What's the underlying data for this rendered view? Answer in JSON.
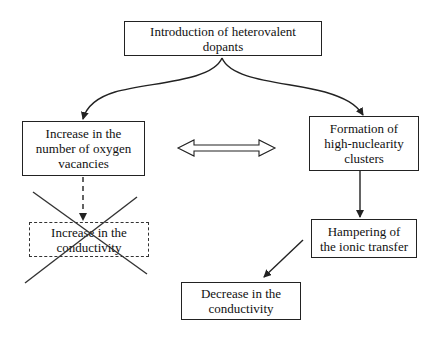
{
  "diagram": {
    "type": "flowchart",
    "nodes": [
      {
        "id": "n1",
        "label": "Introduction  of heterovalent\ndopants",
        "style": "solid"
      },
      {
        "id": "n2",
        "label": "Increase in the\nnumber of oxygen\nvacancies",
        "style": "solid"
      },
      {
        "id": "n3",
        "label": "Formation of\nhigh-nuclearity\nclusters",
        "style": "solid"
      },
      {
        "id": "n4",
        "label": "Increase in the\nconductivity",
        "style": "dashed",
        "crossed_out": true
      },
      {
        "id": "n5",
        "label": "Hampering of\nthe ionic transfer",
        "style": "solid"
      },
      {
        "id": "n6",
        "label": "Decrease in the\nconductivity",
        "style": "solid"
      }
    ],
    "edges": [
      {
        "from": "n1",
        "to": "n2",
        "style": "curved-arrow"
      },
      {
        "from": "n1",
        "to": "n3",
        "style": "curved-arrow"
      },
      {
        "from": "n2",
        "to": "n3",
        "style": "double-headed-hollow-arrow"
      },
      {
        "from": "n2",
        "to": "n4",
        "style": "dashed-arrow"
      },
      {
        "from": "n3",
        "to": "n5",
        "style": "arrow"
      },
      {
        "from": "n5",
        "to": "n6",
        "style": "arrow"
      }
    ],
    "colors": {
      "line": "#222222",
      "background": "#ffffff"
    }
  }
}
